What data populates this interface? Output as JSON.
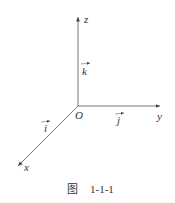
{
  "diagram": {
    "axes": {
      "z_label": "z",
      "y_label": "y",
      "x_label": "x",
      "origin_label": "O"
    },
    "unit_vectors": {
      "i": "i",
      "j": "j",
      "k": "k"
    },
    "caption": {
      "prefix": "图",
      "number": "1-1-1"
    },
    "colors": {
      "line": "#555555",
      "background": "#ffffff"
    }
  }
}
